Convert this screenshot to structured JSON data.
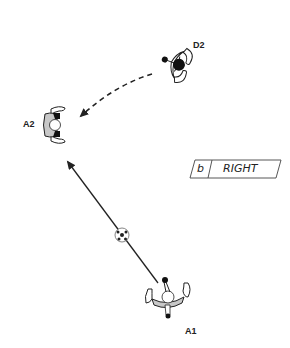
{
  "diagram": {
    "type": "soccer-play-diagram",
    "players": [
      {
        "id": "D2",
        "label": "D2",
        "role": "defender",
        "x": 177,
        "y": 64,
        "rotation": 110
      },
      {
        "id": "A2",
        "label": "A2",
        "role": "attacker",
        "x": 53,
        "y": 125,
        "rotation": 0
      },
      {
        "id": "A1",
        "label": "A1",
        "role": "attacker",
        "x": 168,
        "y": 297,
        "rotation": -90
      }
    ],
    "ball": {
      "x": 122,
      "y": 235
    },
    "arrows": [
      {
        "name": "defender-run",
        "style": "dashed",
        "from": "D2",
        "to": "A2"
      },
      {
        "name": "pass",
        "style": "solid",
        "from": "A1",
        "to": "A2"
      }
    ],
    "tag": {
      "letter": "b",
      "text": "RIGHT"
    },
    "colors": {
      "jersey": "#c8c8c8",
      "outline": "#222222",
      "shoe": "#111111",
      "background": "#ffffff"
    }
  }
}
